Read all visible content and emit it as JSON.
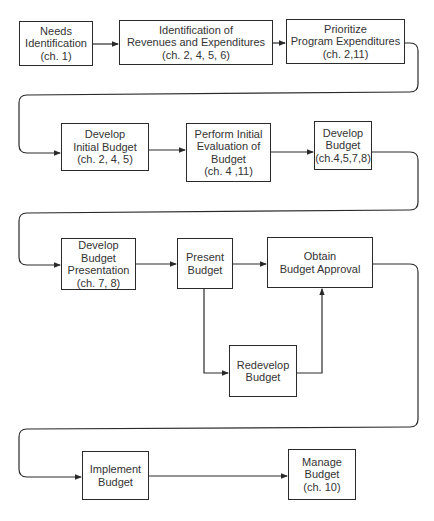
{
  "diagram": {
    "type": "flowchart",
    "nodes": [
      {
        "id": "needs",
        "lines": [
          "Needs",
          "Identification",
          "(ch. 1)"
        ],
        "box": [
          19,
          21,
          74,
          45
        ]
      },
      {
        "id": "identification",
        "lines": [
          "Identification of",
          "Revenues and Expenditures",
          "(ch. 2, 4, 5, 6)"
        ],
        "box": [
          119,
          20,
          154,
          45
        ]
      },
      {
        "id": "prioritize",
        "lines": [
          "Prioritize",
          "Program Expenditures",
          "(ch. 2,11)"
        ],
        "box": [
          286,
          19,
          119,
          45
        ]
      },
      {
        "id": "develop-initial",
        "lines": [
          "Develop",
          "Initial Budget",
          "(ch. 2, 4, 5)"
        ],
        "box": [
          61,
          123,
          88,
          48
        ]
      },
      {
        "id": "perform-evaluation",
        "lines": [
          "Perform Initial",
          "Evaluation of",
          "Budget",
          "(ch. 4 ,11)"
        ],
        "box": [
          186,
          123,
          85,
          59
        ]
      },
      {
        "id": "develop-budget",
        "lines": [
          "Develop",
          "Budget",
          "(ch.4,5,7,8)"
        ],
        "box": [
          314,
          121,
          58,
          49
        ]
      },
      {
        "id": "develop-presentation",
        "lines": [
          "Develop",
          "Budget",
          "Presentation",
          "(ch. 7, 8)"
        ],
        "box": [
          61,
          238,
          75,
          52
        ]
      },
      {
        "id": "present",
        "lines": [
          "Present",
          "Budget"
        ],
        "box": [
          177,
          238,
          56,
          51
        ]
      },
      {
        "id": "obtain-approval",
        "lines": [
          "Obtain",
          "Budget Approval"
        ],
        "box": [
          267,
          237,
          106,
          51
        ]
      },
      {
        "id": "redevelop",
        "lines": [
          "Redevelop",
          "Budget"
        ],
        "box": [
          229,
          345,
          68,
          52
        ]
      },
      {
        "id": "implement",
        "lines": [
          "Implement",
          "Budget"
        ],
        "box": [
          82,
          451,
          67,
          49
        ]
      },
      {
        "id": "manage",
        "lines": [
          "Manage",
          "Budget",
          "(ch. 10)"
        ],
        "box": [
          288,
          449,
          68,
          51
        ]
      }
    ],
    "edges": [
      {
        "from": "needs",
        "to": "identification"
      },
      {
        "from": "identification",
        "to": "prioritize"
      },
      {
        "from": "prioritize",
        "to": "develop-initial"
      },
      {
        "from": "develop-initial",
        "to": "perform-evaluation"
      },
      {
        "from": "perform-evaluation",
        "to": "develop-budget"
      },
      {
        "from": "develop-budget",
        "to": "develop-presentation"
      },
      {
        "from": "develop-presentation",
        "to": "present"
      },
      {
        "from": "present",
        "to": "obtain-approval"
      },
      {
        "from": "present",
        "to": "redevelop"
      },
      {
        "from": "redevelop",
        "to": "obtain-approval"
      },
      {
        "from": "obtain-approval",
        "to": "implement"
      },
      {
        "from": "implement",
        "to": "manage"
      }
    ],
    "colors": {
      "line": "#2a2a2a",
      "text": "#333333",
      "background": "#ffffff"
    }
  }
}
